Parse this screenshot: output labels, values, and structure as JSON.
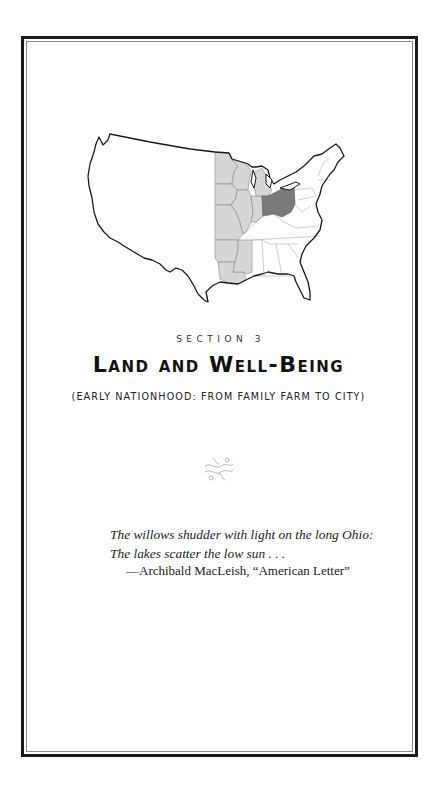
{
  "page": {
    "section_label": "SECTION 3",
    "title": "Land and Well-Being",
    "subtitle": "(EARLY NATIONHOOD: FROM FAMILY FARM TO CITY)",
    "ornament": "decorative-flourish",
    "map": {
      "description": "Outline map of the contiguous United States",
      "highlighted_region_color": "#d4d4d4",
      "focus_state": "Ohio",
      "focus_state_color": "#7a7a7a",
      "outline_color": "#1a1a1a"
    },
    "epigraph": {
      "lines": [
        "The willows shudder with light on the long Ohio:",
        "The lakes scatter the low sun . . ."
      ],
      "attribution": "—Archibald MacLeish, “American Letter”"
    }
  }
}
